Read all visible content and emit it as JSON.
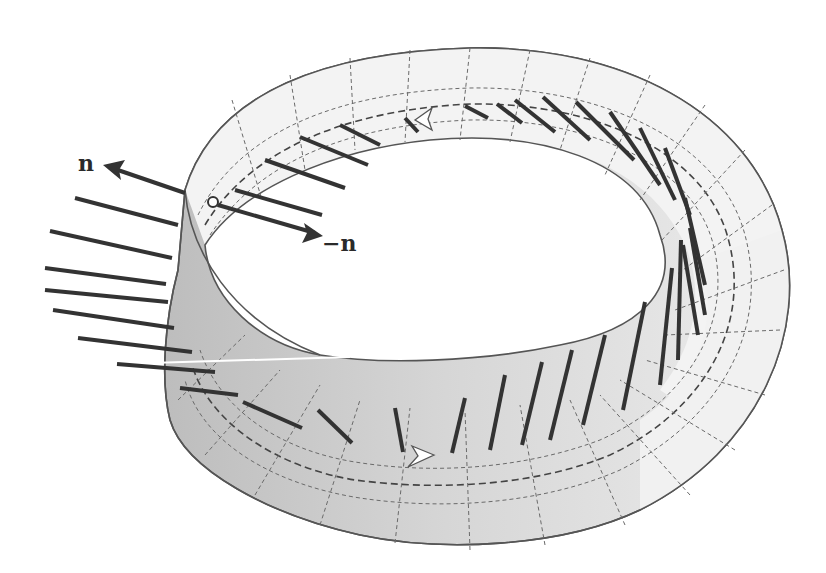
{
  "figure": {
    "labels": {
      "normal": "n",
      "negative_normal": "−n"
    },
    "colors": {
      "background": "#ffffff",
      "strip_light": "#f2f2f2",
      "strip_shaded": "#c9c9c9",
      "outline": "#555555",
      "grid": "#666666",
      "vector": "#333333",
      "arrowhead_fill": "#ffffff"
    }
  }
}
